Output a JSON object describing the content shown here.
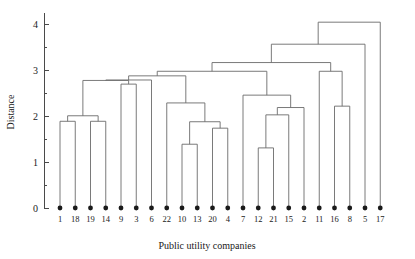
{
  "figure": {
    "width": 415,
    "height": 259,
    "background": "#ffffff",
    "line_color": "#6b6b6b",
    "axis_color": "#4a4a4a",
    "marker_color": "#1a1a1a"
  },
  "chart_data": {
    "type": "dendrogram",
    "title": "",
    "xlabel": "Public utility companies",
    "ylabel": "Distance",
    "ylim": [
      0,
      4.25
    ],
    "yticks": [
      0,
      1,
      2,
      3,
      4
    ],
    "ytick_labels": [
      "0",
      "1",
      "2",
      "3",
      "4"
    ],
    "yminor_ticks": [
      0.5,
      1.5,
      2.5,
      3.5
    ],
    "grid": false,
    "legend": null,
    "leaf_order": [
      "1",
      "18",
      "19",
      "14",
      "9",
      "3",
      "6",
      "22",
      "10",
      "13",
      "20",
      "4",
      "7",
      "12",
      "21",
      "15",
      "2",
      "11",
      "16",
      "8",
      "5",
      "17"
    ],
    "leaf_count": 22,
    "merges": [
      {
        "id": "m1",
        "left": "1",
        "right": "18",
        "height": 1.89
      },
      {
        "id": "m2",
        "left": "19",
        "right": "14",
        "height": 1.89
      },
      {
        "id": "m3",
        "left": "m1",
        "right": "m2",
        "height": 2.01
      },
      {
        "id": "m4",
        "left": "9",
        "right": "3",
        "height": 2.7
      },
      {
        "id": "m5",
        "left": "m3",
        "right": "m4",
        "height": 2.78
      },
      {
        "id": "m6",
        "left": "m5",
        "right": "6",
        "height": 2.79
      },
      {
        "id": "m7",
        "left": "10",
        "right": "13",
        "height": 1.39
      },
      {
        "id": "m8",
        "left": "20",
        "right": "4",
        "height": 1.74
      },
      {
        "id": "m9",
        "left": "m7",
        "right": "m8",
        "height": 1.88
      },
      {
        "id": "m10",
        "left": "22",
        "right": "m9",
        "height": 2.29
      },
      {
        "id": "m11",
        "left": "m6",
        "right": "m10",
        "height": 2.88
      },
      {
        "id": "m12",
        "left": "12",
        "right": "21",
        "height": 1.31
      },
      {
        "id": "m13",
        "left": "m12",
        "right": "15",
        "height": 2.03
      },
      {
        "id": "m14",
        "left": "m13",
        "right": "2",
        "height": 2.19
      },
      {
        "id": "m15",
        "left": "7",
        "right": "m14",
        "height": 2.46
      },
      {
        "id": "m16",
        "left": "m11",
        "right": "m15",
        "height": 2.98
      },
      {
        "id": "m17",
        "left": "16",
        "right": "8",
        "height": 2.22
      },
      {
        "id": "m18",
        "left": "11",
        "right": "m17",
        "height": 2.98
      },
      {
        "id": "m19",
        "left": "m16",
        "right": "m18",
        "height": 3.17
      },
      {
        "id": "m20",
        "left": "m19",
        "right": "5",
        "height": 3.57
      },
      {
        "id": "m21",
        "left": "m20",
        "right": "17",
        "height": 4.05
      }
    ]
  },
  "axes": {
    "y_title": "Distance",
    "x_title": "Public utility companies"
  }
}
